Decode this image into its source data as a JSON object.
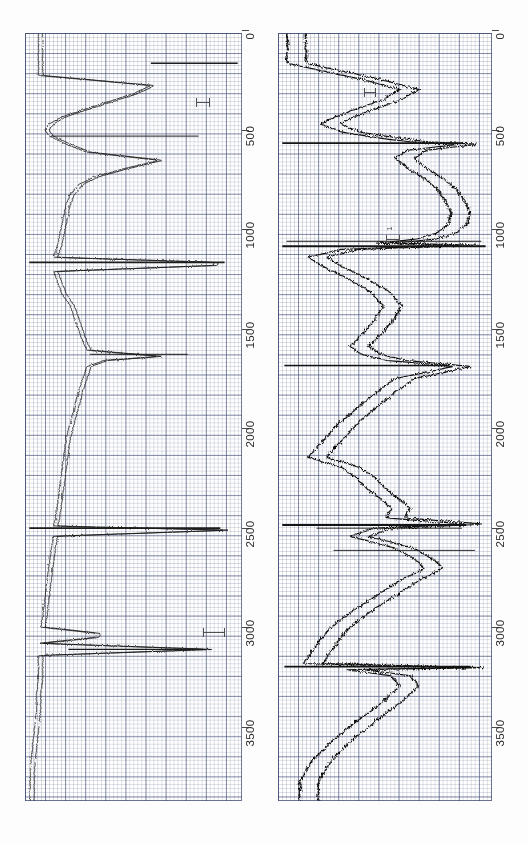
{
  "figure": {
    "orientation": "rotated-90",
    "background_color": "#ffffff",
    "grid_color": "#465078",
    "trace_color": "#1a1a1a"
  },
  "panels": [
    {
      "id": "panel-left",
      "name": "left-log-panel",
      "axis": {
        "name": "depth-axis",
        "ticks": [
          "0",
          "500",
          "1000",
          "1500",
          "2000",
          "2500",
          "3000",
          "3500"
        ],
        "tick_values": [
          0,
          500,
          1000,
          1500,
          2000,
          2500,
          3000,
          3500
        ],
        "range": [
          -150,
          3650
        ]
      },
      "annotations": [
        {
          "label": "",
          "x": 0.82,
          "y": 0.09
        },
        {
          "label": "",
          "x": 0.9,
          "y": 0.745
        }
      ]
    },
    {
      "id": "panel-right",
      "name": "right-log-panel",
      "axis": {
        "name": "depth-axis",
        "ticks": [
          "0",
          "500",
          "1000",
          "1500",
          "2000",
          "2500",
          "3000",
          "3500"
        ],
        "tick_values": [
          0,
          500,
          1000,
          1500,
          2000,
          2500,
          3000,
          3500
        ],
        "range": [
          -150,
          3650
        ]
      },
      "annotations": [
        {
          "label": "1",
          "x": 0.52,
          "y": 0.265
        },
        {
          "label": "1",
          "x": 0.41,
          "y": 0.075
        }
      ]
    }
  ],
  "chart_data": {
    "type": "line",
    "title": "",
    "subtitle": "",
    "xlabel": "",
    "ylabel": "Depth",
    "grid": true,
    "legend": "none",
    "orientation": "horizontal-depth-axis (plot rotated 90 degrees)",
    "axis_ticks": [
      0,
      500,
      1000,
      1500,
      2000,
      2500,
      3000,
      3500
    ],
    "axis_range": [
      -150,
      3650
    ],
    "panels": [
      {
        "panel": "left",
        "series": [
          {
            "name": "trace-a",
            "x": [
              0,
              60,
              110,
              150,
              190,
              230,
              265,
              300,
              330,
              360,
              400,
              440,
              480,
              520,
              560,
              600,
              650,
              700,
              750,
              800,
              850,
              900,
              930,
              960,
              985,
              1000,
              1030,
              1080,
              1140,
              1200,
              1260,
              1320,
              1380,
              1420,
              1450,
              1470,
              1500,
              1560,
              1620,
              1700,
              1780,
              1860,
              1940,
              2020,
              2100,
              2180,
              2250,
              2290,
              2310,
              2340,
              2400,
              2480,
              2560,
              2650,
              2740,
              2790,
              2820,
              2840,
              2870,
              2900,
              2930,
              2960,
              2990,
              3040,
              3120,
              3200,
              3300,
              3400,
              3500,
              3560
            ],
            "values": [
              0.93,
              0.93,
              0.4,
              0.48,
              0.6,
              0.72,
              0.82,
              0.88,
              0.9,
              0.88,
              0.8,
              0.7,
              0.36,
              0.52,
              0.66,
              0.74,
              0.78,
              0.8,
              0.81,
              0.82,
              0.83,
              0.84,
              0.85,
              0.86,
              0.1,
              0.1,
              0.86,
              0.84,
              0.82,
              0.78,
              0.76,
              0.74,
              0.72,
              0.7,
              0.36,
              0.62,
              0.7,
              0.72,
              0.74,
              0.76,
              0.78,
              0.8,
              0.81,
              0.82,
              0.83,
              0.84,
              0.85,
              0.86,
              0.04,
              0.86,
              0.87,
              0.88,
              0.89,
              0.9,
              0.91,
              0.92,
              0.66,
              0.66,
              0.93,
              0.12,
              0.93,
              0.93,
              0.93,
              0.93,
              0.94,
              0.94,
              0.95,
              0.96,
              0.97,
              0.97
            ]
          },
          {
            "name": "trace-b",
            "offset": 0.02
          }
        ]
      },
      {
        "panel": "right",
        "series": [
          {
            "name": "trace-a",
            "x": [
              0,
              80,
              130,
              180,
              230,
              270,
              300,
              340,
              370,
              390,
              400,
              430,
              470,
              520,
              570,
              620,
              680,
              740,
              800,
              840,
              870,
              890,
              900,
              920,
              960,
              1010,
              1070,
              1130,
              1200,
              1270,
              1340,
              1400,
              1440,
              1470,
              1500,
              1560,
              1620,
              1700,
              1790,
              1880,
              1950,
              2000,
              2050,
              2100,
              2150,
              2200,
              2250,
              2280,
              2300,
              2340,
              2400,
              2460,
              2500,
              2560,
              2640,
              2720,
              2800,
              2880,
              2940,
              2970,
              2990,
              3000,
              3030,
              3080,
              3160,
              3250,
              3350,
              3450,
              3550
            ],
            "values": [
              0.88,
              0.52,
              0.34,
              0.42,
              0.56,
              0.66,
              0.72,
              0.62,
              0.44,
              0.28,
              0.05,
              0.3,
              0.36,
              0.3,
              0.22,
              0.16,
              0.12,
              0.09,
              0.11,
              0.16,
              0.26,
              0.45,
              0.05,
              0.62,
              0.78,
              0.7,
              0.58,
              0.48,
              0.42,
              0.46,
              0.52,
              0.58,
              0.52,
              0.4,
              0.08,
              0.36,
              0.44,
              0.54,
              0.64,
              0.72,
              0.78,
              0.62,
              0.55,
              0.5,
              0.44,
              0.38,
              0.4,
              0.02,
              0.46,
              0.58,
              0.36,
              0.26,
              0.22,
              0.34,
              0.46,
              0.58,
              0.68,
              0.74,
              0.78,
              0.8,
              0.02,
              0.6,
              0.38,
              0.34,
              0.42,
              0.54,
              0.66,
              0.76,
              0.82
            ]
          },
          {
            "name": "trace-b",
            "offset": 0.09
          }
        ]
      }
    ]
  }
}
